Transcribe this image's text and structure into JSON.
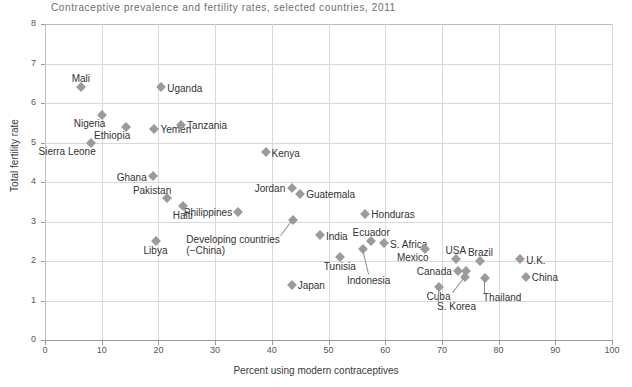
{
  "chart_data": {
    "type": "scatter",
    "title": "Contraceptive prevalence and fertility rates, selected countries, 2011",
    "xlabel": "Percent using modern contraceptives",
    "ylabel": "Total fertility rate",
    "xlim": [
      0,
      100
    ],
    "ylim": [
      0,
      8
    ],
    "xticks": [
      0,
      10,
      20,
      30,
      40,
      50,
      60,
      70,
      80,
      90,
      100
    ],
    "yticks": [
      0,
      1,
      2,
      3,
      4,
      5,
      6,
      7,
      8
    ],
    "grid": true,
    "legend": "none",
    "marker_color": "#9b9b9b",
    "marker_shape": "diamond",
    "points": [
      {
        "label": "Mali",
        "x": 6.3,
        "y": 6.4,
        "label_pos": "top"
      },
      {
        "label": "Uganda",
        "x": 20.5,
        "y": 6.4,
        "label_pos": "right"
      },
      {
        "label": "Nigeria",
        "x": 10.0,
        "y": 5.7,
        "label_pos": "below-left"
      },
      {
        "label": "Ethiopia",
        "x": 14.3,
        "y": 5.4,
        "label_pos": "below-left"
      },
      {
        "label": "Yemen",
        "x": 19.3,
        "y": 5.35,
        "label_pos": "right"
      },
      {
        "label": "Tanzania",
        "x": 24.0,
        "y": 5.45,
        "label_pos": "right"
      },
      {
        "label": "Sierra Leone",
        "x": 8.2,
        "y": 5.0,
        "label_pos": "below-left"
      },
      {
        "label": "Kenya",
        "x": 38.9,
        "y": 4.75,
        "label_pos": "right"
      },
      {
        "label": "Ghana",
        "x": 19.0,
        "y": 4.15,
        "label_pos": "left"
      },
      {
        "label": "Jordan",
        "x": 43.5,
        "y": 3.85,
        "label_pos": "left"
      },
      {
        "label": "Guatemala",
        "x": 45.0,
        "y": 3.7,
        "label_pos": "right"
      },
      {
        "label": "Pakistan",
        "x": 21.5,
        "y": 3.6,
        "label_pos": "above-left"
      },
      {
        "label": "Philippines",
        "x": 34.0,
        "y": 3.25,
        "label_pos": "left"
      },
      {
        "label": "Haiti",
        "x": 24.3,
        "y": 3.4,
        "label_pos": "below"
      },
      {
        "label": "Honduras",
        "x": 56.5,
        "y": 3.2,
        "label_pos": "right"
      },
      {
        "label": "Developing countries\n(−China)",
        "x": 43.8,
        "y": 3.05,
        "label_pos": "leader-below-left"
      },
      {
        "label": "India",
        "x": 48.5,
        "y": 2.65,
        "label_pos": "right"
      },
      {
        "label": "Ecuador",
        "x": 57.5,
        "y": 2.5,
        "label_pos": "above"
      },
      {
        "label": "S. Africa",
        "x": 59.8,
        "y": 2.45,
        "label_pos": "right"
      },
      {
        "label": "Mexico",
        "x": 67.0,
        "y": 2.3,
        "label_pos": "below-left"
      },
      {
        "label": "Libya",
        "x": 19.5,
        "y": 2.5,
        "label_pos": "below"
      },
      {
        "label": "Tunisia",
        "x": 52.0,
        "y": 2.1,
        "label_pos": "below"
      },
      {
        "label": "Indonesia",
        "x": 56.0,
        "y": 2.3,
        "label_pos": "leader-below"
      },
      {
        "label": "USA",
        "x": 72.5,
        "y": 2.05,
        "label_pos": "above"
      },
      {
        "label": "Brazil",
        "x": 76.8,
        "y": 2.0,
        "label_pos": "above"
      },
      {
        "label": "U.K.",
        "x": 83.8,
        "y": 2.05,
        "label_pos": "right"
      },
      {
        "label": "Canada",
        "x": 72.8,
        "y": 1.75,
        "label_pos": "left"
      },
      {
        "label": "Canada-2",
        "x": 74.2,
        "y": 1.75,
        "label_pos": "none"
      },
      {
        "label": "Cuba",
        "x": 74.0,
        "y": 1.6,
        "label_pos": "leader-below-left"
      },
      {
        "label": "Thailand",
        "x": 77.6,
        "y": 1.58,
        "label_pos": "leader-below-right"
      },
      {
        "label": "China",
        "x": 84.8,
        "y": 1.6,
        "label_pos": "right"
      },
      {
        "label": "S. Korea",
        "x": 69.5,
        "y": 1.35,
        "label_pos": "leader-below-right"
      },
      {
        "label": "Japan",
        "x": 43.5,
        "y": 1.4,
        "label_pos": "right"
      }
    ]
  }
}
